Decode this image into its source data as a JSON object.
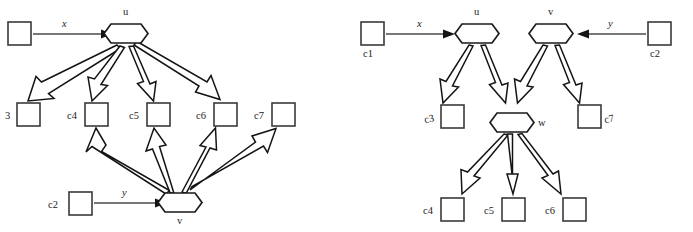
{
  "figure": {
    "background_color": "#ffffff",
    "stroke_color": "#141414",
    "box_stroke_color": "#3a3a3a",
    "thin_arrow_color": "#4a4a4a"
  },
  "left_diagram": {
    "name": "left-graph",
    "hex_nodes": [
      {
        "id": "u",
        "label": "u",
        "cx": 126,
        "cy": 33,
        "label_x": 124,
        "label_y": 15
      },
      {
        "id": "v",
        "label": "v",
        "cx": 180,
        "cy": 202,
        "label_x": 178,
        "label_y": 224
      }
    ],
    "box_nodes": [
      {
        "id": "src1",
        "label": "",
        "x": 8,
        "y": 22,
        "w": 23,
        "h": 23,
        "label_x": 0,
        "label_y": 0
      },
      {
        "id": "c3",
        "label": "3",
        "x": 17,
        "y": 103,
        "w": 23,
        "h": 23,
        "label_x": 6,
        "label_y": 119
      },
      {
        "id": "c4",
        "label": "c4",
        "x": 85,
        "y": 103,
        "w": 23,
        "h": 23,
        "label_x": 68,
        "label_y": 119
      },
      {
        "id": "c5",
        "label": "c5",
        "x": 147,
        "y": 103,
        "w": 23,
        "h": 23,
        "label_x": 130,
        "label_y": 119
      },
      {
        "id": "c6",
        "label": "c6",
        "x": 214,
        "y": 103,
        "w": 23,
        "h": 23,
        "label_x": 197,
        "label_y": 119
      },
      {
        "id": "c7",
        "label": "c7",
        "x": 272,
        "y": 103,
        "w": 23,
        "h": 23,
        "label_x": 255,
        "label_y": 119
      },
      {
        "id": "c2",
        "label": "c2",
        "x": 69,
        "y": 192,
        "w": 23,
        "h": 23,
        "label_x": 49,
        "label_y": 208
      }
    ],
    "thin_edges": [
      {
        "id": "x-edge",
        "label": "x",
        "label_x": 62,
        "label_y": 26,
        "x1": 33,
        "y1": 34,
        "x2": 103,
        "y2": 34
      },
      {
        "id": "y-edge",
        "label": "y",
        "label_x": 122,
        "label_y": 195,
        "x1": 94,
        "y1": 203,
        "x2": 157,
        "y2": 203
      }
    ],
    "hollow_edges": [
      {
        "id": "u-to-c3",
        "from": "u",
        "to": "c3"
      },
      {
        "id": "u-to-c4",
        "from": "u",
        "to": "c4"
      },
      {
        "id": "u-to-c5",
        "from": "u",
        "to": "c5"
      },
      {
        "id": "u-to-c6",
        "from": "u",
        "to": "c6"
      },
      {
        "id": "v-to-c4",
        "from": "v",
        "to": "c4"
      },
      {
        "id": "v-to-c5",
        "from": "v",
        "to": "c5"
      },
      {
        "id": "v-to-c6",
        "from": "v",
        "to": "c6"
      },
      {
        "id": "v-to-c7",
        "from": "v",
        "to": "c7"
      }
    ]
  },
  "right_diagram": {
    "name": "right-graph",
    "hex_nodes": [
      {
        "id": "u",
        "label": "u",
        "cx": 477,
        "cy": 33,
        "label_x": 475,
        "label_y": 15
      },
      {
        "id": "v",
        "label": "v",
        "cx": 551,
        "cy": 33,
        "label_x": 549,
        "label_y": 15
      },
      {
        "id": "w",
        "label": "w",
        "cx": 512,
        "cy": 122,
        "label_x": 534,
        "label_y": 126
      }
    ],
    "box_nodes": [
      {
        "id": "c1",
        "label": "c1",
        "x": 361,
        "y": 22,
        "w": 23,
        "h": 23,
        "label_x": 363,
        "label_y": 56
      },
      {
        "id": "c2",
        "label": "c2",
        "x": 648,
        "y": 22,
        "w": 23,
        "h": 23,
        "label_x": 650,
        "label_y": 56
      },
      {
        "id": "c3",
        "label": "c3",
        "x": 441,
        "y": 105,
        "w": 23,
        "h": 23,
        "label_x": 425,
        "label_y": 121
      },
      {
        "id": "c7",
        "label": "c7",
        "x": 578,
        "y": 105,
        "w": 23,
        "h": 23,
        "label_x": 606,
        "label_y": 121
      },
      {
        "id": "c4",
        "label": "c4",
        "x": 441,
        "y": 198,
        "w": 23,
        "h": 23,
        "label_x": 424,
        "label_y": 214
      },
      {
        "id": "c5",
        "label": "c5",
        "x": 502,
        "y": 198,
        "w": 23,
        "h": 23,
        "label_x": 486,
        "label_y": 214
      },
      {
        "id": "c6",
        "label": "c6",
        "x": 563,
        "y": 198,
        "w": 23,
        "h": 23,
        "label_x": 546,
        "label_y": 214
      }
    ],
    "thin_edges": [
      {
        "id": "x-edge",
        "label": "x",
        "label_x": 418,
        "label_y": 26,
        "x1": 386,
        "y1": 34,
        "x2": 454,
        "y2": 34
      },
      {
        "id": "y-edge",
        "label": "y",
        "label_x": 609,
        "label_y": 26,
        "x1": 646,
        "y1": 34,
        "x2": 578,
        "y2": 34
      }
    ],
    "hollow_edges": [
      {
        "id": "u-to-c3",
        "from": "u",
        "to": "c3"
      },
      {
        "id": "u-to-w",
        "from": "u",
        "to": "w"
      },
      {
        "id": "v-to-w",
        "from": "v",
        "to": "w"
      },
      {
        "id": "v-to-c7",
        "from": "v",
        "to": "c7"
      },
      {
        "id": "w-to-c4",
        "from": "w",
        "to": "c4"
      },
      {
        "id": "w-to-c5",
        "from": "w",
        "to": "c5"
      },
      {
        "id": "w-to-c6",
        "from": "w",
        "to": "c6"
      }
    ]
  }
}
